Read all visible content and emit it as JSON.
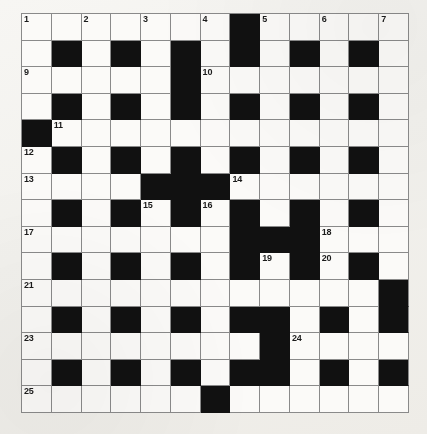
{
  "puzzle": {
    "title": "Crossword Grid",
    "type": "crossword",
    "rows": 13,
    "cols": 13,
    "colors": {
      "block": "#111111",
      "light": "#fbfaf8",
      "gridline": "#8a8a8a",
      "page": "#f4f3f0",
      "number_text": "#1b1b1b"
    },
    "legend": {
      "black_char": "#",
      "white_char": "."
    },
    "grid_pattern": [
      ".......#.....",
      ".#.#.#.#.#.#.",
      ".....#.......",
      ".#.#.#.#.#.#.",
      "#............",
      ".#.#.#.#.#.#.",
      "....###......",
      ".#.#.#.#.#.#.",
      ".......###...",
      ".#.#.#.#.#.#.",
      "............#",
      ".#.#.#.##.#.#",
      "........#....",
      ".#.#.#.##.#.#",
      "......#......"
    ],
    "grid_rows": [
      [
        ".",
        ".",
        ".",
        ".",
        ".",
        ".",
        ".",
        "#",
        ".",
        ".",
        ".",
        ".",
        "."
      ],
      [
        ".",
        "#",
        ".",
        "#",
        ".",
        "#",
        ".",
        "#",
        ".",
        "#",
        ".",
        "#",
        "."
      ],
      [
        ".",
        ".",
        ".",
        ".",
        ".",
        "#",
        ".",
        ".",
        ".",
        ".",
        ".",
        ".",
        "."
      ],
      [
        ".",
        "#",
        ".",
        "#",
        ".",
        "#",
        ".",
        "#",
        ".",
        "#",
        ".",
        "#",
        "."
      ],
      [
        "#",
        ".",
        ".",
        ".",
        ".",
        ".",
        ".",
        ".",
        ".",
        ".",
        ".",
        ".",
        "."
      ],
      [
        ".",
        "#",
        ".",
        "#",
        ".",
        "#",
        ".",
        "#",
        ".",
        "#",
        ".",
        "#",
        "."
      ],
      [
        ".",
        ".",
        ".",
        ".",
        "#",
        "#",
        "#",
        ".",
        ".",
        ".",
        ".",
        ".",
        "."
      ],
      [
        ".",
        "#",
        ".",
        "#",
        ".",
        "#",
        ".",
        "#",
        ".",
        "#",
        ".",
        "#",
        "."
      ],
      [
        ".",
        ".",
        ".",
        ".",
        ".",
        ".",
        ".",
        "#",
        "#",
        "#",
        ".",
        ".",
        "."
      ],
      [
        ".",
        "#",
        ".",
        "#",
        ".",
        "#",
        ".",
        "#",
        ".",
        "#",
        ".",
        "#",
        "."
      ],
      [
        ".",
        ".",
        ".",
        ".",
        ".",
        ".",
        ".",
        ".",
        ".",
        ".",
        ".",
        ".",
        "#"
      ],
      [
        ".",
        "#",
        ".",
        "#",
        ".",
        "#",
        ".",
        "#",
        "#",
        ".",
        "#",
        ".",
        "#"
      ],
      [
        ".",
        ".",
        ".",
        ".",
        ".",
        ".",
        ".",
        ".",
        "#",
        ".",
        ".",
        ".",
        "."
      ],
      [
        ".",
        "#",
        ".",
        "#",
        ".",
        "#",
        ".",
        "#",
        "#",
        ".",
        "#",
        ".",
        "#"
      ],
      [
        ".",
        ".",
        ".",
        ".",
        ".",
        ".",
        "#",
        ".",
        ".",
        ".",
        ".",
        ".",
        "."
      ]
    ],
    "clue_numbers": [
      {
        "number": "1",
        "row": 1,
        "col": 1
      },
      {
        "number": "2",
        "row": 1,
        "col": 3
      },
      {
        "number": "3",
        "row": 1,
        "col": 5
      },
      {
        "number": "4",
        "row": 1,
        "col": 7
      },
      {
        "number": "5",
        "row": 1,
        "col": 9
      },
      {
        "number": "6",
        "row": 1,
        "col": 11
      },
      {
        "number": "7",
        "row": 1,
        "col": 13
      },
      {
        "number": "8",
        "row": 1,
        "col": 15
      },
      {
        "number": "9",
        "row": 3,
        "col": 1
      },
      {
        "number": "10",
        "row": 3,
        "col": 7
      },
      {
        "number": "11",
        "row": 5,
        "col": 2
      },
      {
        "number": "12",
        "row": 6,
        "col": 1
      },
      {
        "number": "13",
        "row": 7,
        "col": 1
      },
      {
        "number": "14",
        "row": 7,
        "col": 8
      },
      {
        "number": "15",
        "row": 8,
        "col": 5
      },
      {
        "number": "16",
        "row": 8,
        "col": 7
      },
      {
        "number": "17",
        "row": 9,
        "col": 1
      },
      {
        "number": "18",
        "row": 9,
        "col": 11
      },
      {
        "number": "19",
        "row": 10,
        "col": 9
      },
      {
        "number": "20",
        "row": 10,
        "col": 11
      },
      {
        "number": "21",
        "row": 11,
        "col": 1
      },
      {
        "number": "22",
        "row": 12,
        "col": 13
      },
      {
        "number": "23",
        "row": 13,
        "col": 1
      },
      {
        "number": "24",
        "row": 13,
        "col": 10
      },
      {
        "number": "25",
        "row": 15,
        "col": 1
      },
      {
        "number": "26",
        "row": 15,
        "col": 7
      }
    ]
  }
}
